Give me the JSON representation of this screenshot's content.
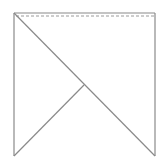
{
  "diagram": {
    "width": 166,
    "height": 167,
    "background": "#ffffff",
    "stroke_color": "#8a8a8a",
    "dashed_color": "#9a9a9a",
    "square": {
      "x1": 14,
      "y1": 13,
      "x2": 155,
      "y2": 156
    },
    "dashed_line": {
      "x1": 16,
      "y1": 16,
      "x2": 155,
      "y2": 16
    },
    "diagonal": {
      "x1": 14,
      "y1": 13,
      "x2": 155,
      "y2": 156
    },
    "branch": {
      "x1": 84,
      "y1": 85,
      "x2": 14,
      "y2": 156
    },
    "points": [
      {
        "name": "top-left",
        "x": 14,
        "y": 13
      },
      {
        "name": "top-right",
        "x": 155,
        "y": 13
      },
      {
        "name": "bottom-right",
        "x": 155,
        "y": 156
      },
      {
        "name": "bottom-left",
        "x": 14,
        "y": 156
      },
      {
        "name": "junction",
        "x": 84,
        "y": 85
      }
    ]
  }
}
